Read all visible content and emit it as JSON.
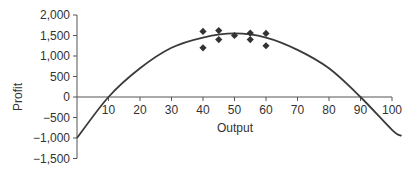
{
  "chart_data": {
    "type": "scatter",
    "title": "",
    "xlabel": "Output",
    "ylabel": "Profit",
    "xlim": [
      0,
      100
    ],
    "ylim": [
      -1500,
      2000
    ],
    "x_ticks": [
      10,
      20,
      30,
      40,
      50,
      60,
      70,
      80,
      90,
      100
    ],
    "x_tick_labels": [
      "10",
      "20",
      "30",
      "40",
      "50",
      "60",
      "70",
      "80",
      "90",
      "100"
    ],
    "y_ticks": [
      2000,
      1500,
      1000,
      500,
      0,
      -500,
      -1000,
      -1500
    ],
    "y_tick_labels": [
      "2,000",
      "1,500",
      "1,000",
      "500",
      "0",
      "−500",
      "−1,000",
      "−1,500"
    ],
    "grid": false,
    "legend": null,
    "series": [
      {
        "name": "Observed",
        "type": "scatter",
        "marker": "diamond",
        "color": "#333333",
        "points": [
          {
            "x": 40,
            "y": 1600
          },
          {
            "x": 40,
            "y": 1200
          },
          {
            "x": 45,
            "y": 1620
          },
          {
            "x": 45,
            "y": 1400
          },
          {
            "x": 50,
            "y": 1500
          },
          {
            "x": 55,
            "y": 1560
          },
          {
            "x": 55,
            "y": 1400
          },
          {
            "x": 60,
            "y": 1550
          },
          {
            "x": 60,
            "y": 1250
          }
        ]
      },
      {
        "name": "Fitted profit curve",
        "type": "line",
        "color": "#333333",
        "points": [
          {
            "x": 0,
            "y": -1000
          },
          {
            "x": 10,
            "y": 0
          },
          {
            "x": 20,
            "y": 700
          },
          {
            "x": 30,
            "y": 1200
          },
          {
            "x": 40,
            "y": 1450
          },
          {
            "x": 50,
            "y": 1550
          },
          {
            "x": 60,
            "y": 1450
          },
          {
            "x": 70,
            "y": 1150
          },
          {
            "x": 80,
            "y": 700
          },
          {
            "x": 90,
            "y": 0
          },
          {
            "x": 100,
            "y": -800
          },
          {
            "x": 103,
            "y": -950
          }
        ]
      }
    ]
  }
}
